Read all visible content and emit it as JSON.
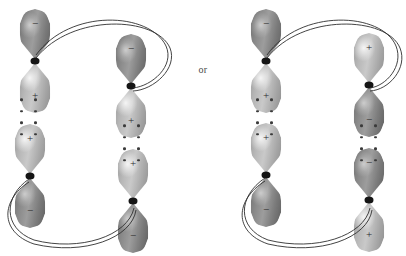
{
  "figure": {
    "background_color": "#ffffff",
    "connector_label": "or",
    "sign_positive": "+",
    "sign_negative": "−",
    "colors": {
      "lobe_dark": "#8a8a8a",
      "lobe_light": "#c0c0c0",
      "node": "#151515",
      "arc": "#2f2f2f",
      "dot": "#3a3a3a",
      "text": "#2b2b2b"
    }
  },
  "diagrams": [
    {
      "id": "left",
      "name": "suprafacial-suprafacial",
      "orbitals": [
        {
          "id": "left-top-left",
          "x": 35,
          "y": 61,
          "top_lobe": {
            "shade": "dark",
            "sign": "−"
          },
          "bottom_lobe": {
            "shade": "light",
            "sign": "+"
          }
        },
        {
          "id": "left-top-right",
          "x": 131,
          "y": 86,
          "top_lobe": {
            "shade": "dark",
            "sign": "−"
          },
          "bottom_lobe": {
            "shade": "light",
            "sign": "+"
          }
        },
        {
          "id": "left-bottom-left",
          "x": 30,
          "y": 176,
          "top_lobe": {
            "shade": "light",
            "sign": "+"
          },
          "bottom_lobe": {
            "shade": "dark",
            "sign": "−"
          }
        },
        {
          "id": "left-bottom-right",
          "x": 133,
          "y": 201,
          "top_lobe": {
            "shade": "light",
            "sign": "+"
          },
          "bottom_lobe": {
            "shade": "dark",
            "sign": "−"
          }
        }
      ],
      "dot_columns": [
        {
          "id": "left-dots-left",
          "x": 29,
          "y": 117,
          "rows": 4
        },
        {
          "id": "left-dots-right",
          "x": 132,
          "y": 143,
          "rows": 4
        }
      ],
      "arcs": [
        {
          "id": "left-top-arc",
          "d": "M 36,55 C 70,8 150,12 166,46 C 175,66 152,86 133,88"
        },
        {
          "id": "left-top-arc-2",
          "d": "M 36,58 C 72,13 156,16 170,48 C 178,68 154,90 133,91"
        },
        {
          "id": "left-bottom-arc",
          "d": "M 29,179 C 4,196 2,228 34,240 C 80,252 128,236 134,208"
        },
        {
          "id": "left-bottom-arc-2",
          "d": "M 29,182 C 1,200 -1,232 34,244 C 84,256 132,238 136,210"
        }
      ]
    },
    {
      "id": "right",
      "name": "suprafacial-antarafacial",
      "orbitals": [
        {
          "id": "right-top-left",
          "x": 266,
          "y": 61,
          "top_lobe": {
            "shade": "dark",
            "sign": "−"
          },
          "bottom_lobe": {
            "shade": "light",
            "sign": "+"
          }
        },
        {
          "id": "right-top-right",
          "x": 369,
          "y": 85,
          "top_lobe": {
            "shade": "light",
            "sign": "+"
          },
          "bottom_lobe": {
            "shade": "dark",
            "sign": "−"
          }
        },
        {
          "id": "right-bottom-left",
          "x": 266,
          "y": 175,
          "top_lobe": {
            "shade": "light",
            "sign": "+"
          },
          "bottom_lobe": {
            "shade": "dark",
            "sign": "−"
          }
        },
        {
          "id": "right-bottom-right",
          "x": 369,
          "y": 200,
          "top_lobe": {
            "shade": "dark",
            "sign": "−"
          },
          "bottom_lobe": {
            "shade": "light",
            "sign": "+"
          }
        }
      ],
      "dot_columns": [
        {
          "id": "right-dots-left",
          "x": 265,
          "y": 117,
          "rows": 4
        },
        {
          "id": "right-dots-right",
          "x": 369,
          "y": 143,
          "rows": 4
        }
      ],
      "arcs": [
        {
          "id": "right-top-arc",
          "d": "M 267,55 C 300,8 382,12 396,46 C 404,66 386,86 370,88"
        },
        {
          "id": "right-top-arc-2",
          "d": "M 267,58 C 302,13 387,16 400,48 C 408,68 389,90 370,91"
        },
        {
          "id": "right-bottom-arc",
          "d": "M 265,178 C 238,196 236,228 268,240 C 316,252 364,236 370,208"
        },
        {
          "id": "right-bottom-arc-2",
          "d": "M 265,181 C 235,200 233,232 268,244 C 320,256 368,238 372,210"
        }
      ]
    }
  ]
}
